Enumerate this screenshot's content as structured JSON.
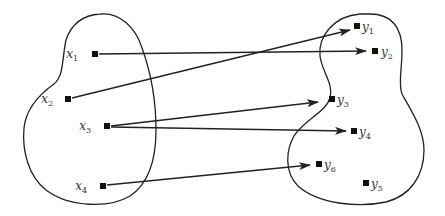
{
  "diagram": {
    "type": "set-mapping",
    "stroke_color": "#222222",
    "domain_set": {
      "elements": [
        {
          "id": "x1",
          "base": "x",
          "sub": "1",
          "x": 95,
          "y": 54,
          "label_x": 78,
          "label_y": 58
        },
        {
          "id": "x2",
          "base": "x",
          "sub": "2",
          "x": 68,
          "y": 99,
          "label_x": 53,
          "label_y": 103
        },
        {
          "id": "x3",
          "base": "x",
          "sub": "3",
          "x": 107,
          "y": 126,
          "label_x": 91,
          "label_y": 130
        },
        {
          "id": "x4",
          "base": "x",
          "sub": "4",
          "x": 103,
          "y": 186,
          "label_x": 87,
          "label_y": 190
        }
      ]
    },
    "codomain_set": {
      "elements": [
        {
          "id": "y1",
          "base": "y",
          "sub": "1",
          "x": 357,
          "y": 26,
          "label_x": 362,
          "label_y": 31
        },
        {
          "id": "y2",
          "base": "y",
          "sub": "2",
          "x": 375,
          "y": 51,
          "label_x": 381,
          "label_y": 56
        },
        {
          "id": "y3",
          "base": "y",
          "sub": "3",
          "x": 332,
          "y": 99,
          "label_x": 337,
          "label_y": 104
        },
        {
          "id": "y4",
          "base": "y",
          "sub": "4",
          "x": 354,
          "y": 131,
          "label_x": 359,
          "label_y": 136
        },
        {
          "id": "y6",
          "base": "y",
          "sub": "6",
          "x": 319,
          "y": 164,
          "label_x": 324,
          "label_y": 169
        },
        {
          "id": "y5",
          "base": "y",
          "sub": "5",
          "x": 366,
          "y": 183,
          "label_x": 371,
          "label_y": 188
        }
      ]
    },
    "mappings": [
      {
        "from": "x1",
        "to": "y2",
        "x1": 99,
        "y1": 54,
        "x2": 366,
        "y2": 51
      },
      {
        "from": "x2",
        "to": "y1",
        "x1": 72,
        "y1": 98,
        "x2": 350,
        "y2": 30
      },
      {
        "from": "x3",
        "to": "y3",
        "x1": 111,
        "y1": 126,
        "x2": 318,
        "y2": 102
      },
      {
        "from": "x3",
        "to": "y4",
        "x1": 111,
        "y1": 127,
        "x2": 346,
        "y2": 131
      },
      {
        "from": "x4",
        "to": "y6",
        "x1": 107,
        "y1": 185,
        "x2": 310,
        "y2": 165
      }
    ]
  }
}
